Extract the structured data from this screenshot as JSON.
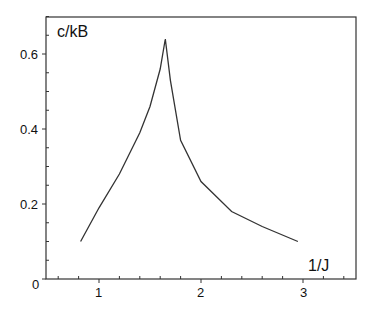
{
  "chart_data": {
    "type": "line",
    "title": "",
    "xlabel": "1/J",
    "ylabel": "c/kB",
    "xlim": [
      0,
      3.5
    ],
    "ylim": [
      0,
      0.7
    ],
    "x_ticks": [
      "1",
      "2",
      "3"
    ],
    "y_ticks": [
      "0",
      "0.2",
      "0.4",
      "0.6"
    ],
    "grid": false,
    "legend": null,
    "series": [
      {
        "name": "c/kB",
        "x": [
          0.82,
          1.0,
          1.2,
          1.4,
          1.5,
          1.6,
          1.65,
          1.7,
          1.8,
          2.0,
          2.3,
          2.6,
          2.95
        ],
        "y": [
          0.1,
          0.19,
          0.28,
          0.39,
          0.46,
          0.56,
          0.64,
          0.53,
          0.37,
          0.26,
          0.18,
          0.14,
          0.1
        ]
      }
    ]
  },
  "labels": {
    "ylabel": "c/kB",
    "xlabel": "1/J",
    "origin": "0",
    "x1": "1",
    "x2": "2",
    "x3": "3",
    "y02": "0.2",
    "y04": "0.4",
    "y06": "0.6"
  }
}
